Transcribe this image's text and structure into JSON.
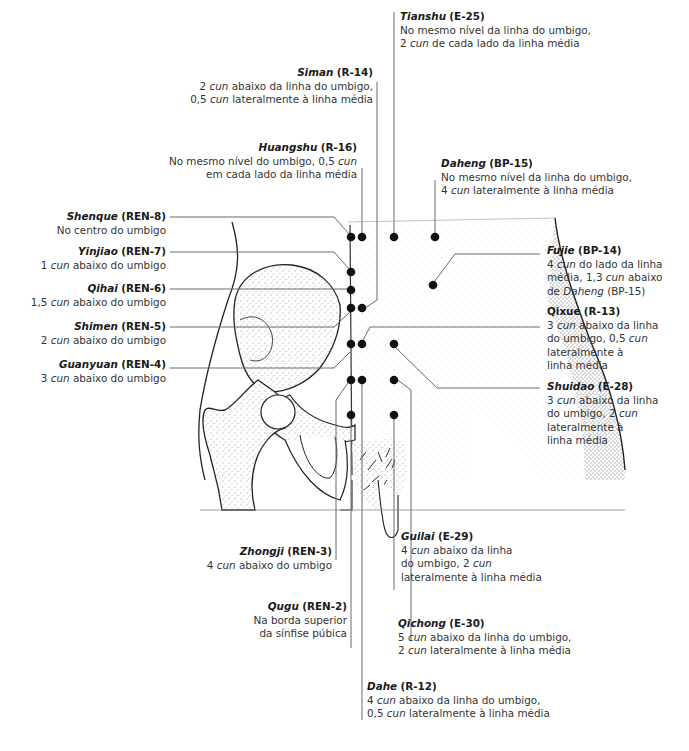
{
  "figure": {
    "colors": {
      "ink": "#1a1a1a",
      "leader": "#6a6a6a",
      "point": "#111111",
      "stipple": "#9a9a9a"
    }
  },
  "points": [
    {
      "id": "tianshu",
      "name": "Tianshu",
      "code": "(E-25)",
      "lines": [
        "No mesmo nível da linha do umbigo,",
        "2 cun de cada lado da linha média"
      ]
    },
    {
      "id": "siman",
      "name": "Siman",
      "code": "(R-14)",
      "lines": [
        "2 cun abaixo da linha do umbigo,",
        "0,5 cun lateralmente à linha média"
      ]
    },
    {
      "id": "huangshu",
      "name": "Huangshu",
      "code": "(R-16)",
      "lines": [
        "No mesmo nível do umbigo, 0,5 cun",
        "em cada lado da linha média"
      ]
    },
    {
      "id": "daheng",
      "name": "Daheng",
      "code": "(BP-15)",
      "lines": [
        "No mesmo nível da linha do umbigo,",
        "4 cun lateralmente à linha média"
      ]
    },
    {
      "id": "shenque",
      "name": "Shenque",
      "code": "(REN-8)",
      "lines": [
        "No centro do umbigo"
      ]
    },
    {
      "id": "yinjiao",
      "name": "Yinjiao",
      "code": "(REN-7)",
      "lines": [
        "1 cun abaixo do umbigo"
      ]
    },
    {
      "id": "qihai",
      "name": "Qihai",
      "code": "(REN-6)",
      "lines": [
        "1,5 cun abaixo do umbigo"
      ]
    },
    {
      "id": "shimen",
      "name": "Shimen",
      "code": "(REN-5)",
      "lines": [
        "2 cun abaixo do umbigo"
      ]
    },
    {
      "id": "guanyuan",
      "name": "Guanyuan",
      "code": "(REN-4)",
      "lines": [
        "3 cun abaixo do umbigo"
      ]
    },
    {
      "id": "fujie",
      "name": "Fujie",
      "code": "(BP-14)",
      "lines": [
        "4 cun do lado da linha",
        "média, 1,3 cun abaixo",
        "de Daheng (BP-15)"
      ]
    },
    {
      "id": "qixue",
      "name": "Qixue",
      "code": "(R-13)",
      "lines": [
        "3 cun abaixo da linha",
        "do umbigo, 0,5 cun",
        "lateralmente à",
        "linha média"
      ]
    },
    {
      "id": "shuidao",
      "name": "Shuidao",
      "code": "(E-28)",
      "lines": [
        "3 cun abaixo da linha",
        "do umbigo, 2 cun",
        "lateralmente à",
        "linha média"
      ]
    },
    {
      "id": "zhongji",
      "name": "Zhongji",
      "code": "(REN-3)",
      "lines": [
        "4 cun abaixo do umbigo"
      ]
    },
    {
      "id": "guilai",
      "name": "Guilai",
      "code": "(E-29)",
      "lines": [
        "4 cun abaixo da linha",
        "do umbigo, 2 cun",
        "lateralmente à linha média"
      ]
    },
    {
      "id": "qugu",
      "name": "Qugu",
      "code": "(REN-2)",
      "lines": [
        "Na borda superior",
        "da sínfise púbica"
      ]
    },
    {
      "id": "qichong",
      "name": "Qichong",
      "code": "(E-30)",
      "lines": [
        "5 cun abaixo da linha do umbigo,",
        "2 cun lateralmente à linha média"
      ]
    },
    {
      "id": "dahe",
      "name": "Dahe",
      "code": "(R-12)",
      "lines": [
        "4 cun abaixo da linha do umbigo,",
        "0,5 cun lateralmente à linha média"
      ]
    }
  ],
  "unit_term": "cun"
}
